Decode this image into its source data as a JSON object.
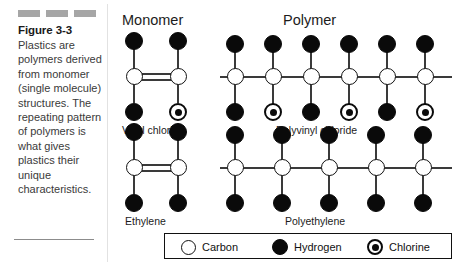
{
  "figure": {
    "title": "Figure 3-3",
    "caption": "Plastics are polymers derived from monomer (single molecule) structures. The repeating pattern of polymers is what gives plastics their unique characteristics.",
    "swatch_color": "#a6a6a6",
    "swatch_count": 3
  },
  "columns": {
    "monomer_heading": "Monomer",
    "polymer_heading": "Polymer"
  },
  "structures": {
    "vinyl_chloride": {
      "label": "Vinyl chloride",
      "type": "monomer",
      "bond": "double",
      "carbons": 2,
      "atoms": [
        "Hydrogen",
        "Hydrogen",
        "Carbon",
        "Carbon",
        "Hydrogen",
        "Chlorine"
      ]
    },
    "polyvinyl_chloride": {
      "label": "Polyvinyl chloride",
      "type": "polymer",
      "bond": "single",
      "carbons": 6,
      "top_substituents": [
        "Hydrogen",
        "Hydrogen",
        "Hydrogen",
        "Hydrogen",
        "Hydrogen",
        "Hydrogen"
      ],
      "bottom_substituents": [
        "Hydrogen",
        "Chlorine",
        "Hydrogen",
        "Chlorine",
        "Hydrogen",
        "Chlorine"
      ]
    },
    "ethylene": {
      "label": "Ethylene",
      "type": "monomer",
      "bond": "double",
      "carbons": 2,
      "atoms": [
        "Hydrogen",
        "Hydrogen",
        "Carbon",
        "Carbon",
        "Hydrogen",
        "Hydrogen"
      ]
    },
    "polyethylene": {
      "label": "Polyethylene",
      "type": "polymer",
      "bond": "single",
      "carbons": 5,
      "top_substituents": [
        "Hydrogen",
        "Hydrogen",
        "Hydrogen",
        "Hydrogen",
        "Hydrogen"
      ],
      "bottom_substituents": [
        "Hydrogen",
        "Hydrogen",
        "Hydrogen",
        "Hydrogen",
        "Hydrogen"
      ]
    }
  },
  "legend": {
    "items": [
      {
        "label": "Carbon",
        "symbol": "open-circle",
        "fill": "#ffffff",
        "stroke": "#111111"
      },
      {
        "label": "Hydrogen",
        "symbol": "filled-circle",
        "fill": "#0a0a0a",
        "stroke": "#0a0a0a"
      },
      {
        "label": "Chlorine",
        "symbol": "dotted-circle",
        "fill": "#ffffff",
        "stroke": "#0a0a0a"
      }
    ]
  }
}
